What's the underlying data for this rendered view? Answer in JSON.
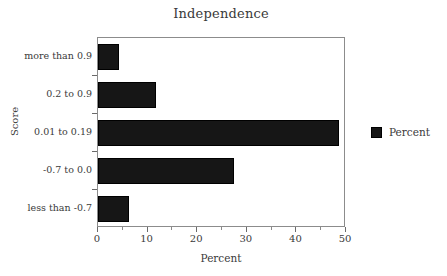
{
  "chart_data": {
    "type": "bar",
    "orientation": "horizontal",
    "title": "Independence",
    "xlabel": "Percent",
    "ylabel": "Score",
    "categories": [
      "less than -0.7",
      "-0.7 to 0.0",
      "0.01 to 0.19",
      "0.2 to 0.9",
      "more than 0.9"
    ],
    "values": [
      6.3,
      27.4,
      48.5,
      11.7,
      4.2
    ],
    "series": [
      {
        "name": "Percent",
        "values": [
          6.3,
          27.4,
          48.5,
          11.7,
          4.2
        ],
        "color": "#161616"
      }
    ],
    "xlim": [
      0,
      50
    ],
    "x_major_ticks": [
      0,
      10,
      20,
      30,
      40,
      50
    ],
    "x_tick_labels": [
      "0",
      "10",
      "20",
      "30",
      "40",
      "50"
    ],
    "x_minor_ticks": [
      5,
      15,
      25,
      35,
      45
    ],
    "grid": false,
    "legend": {
      "position": "right",
      "entries": [
        {
          "label": "Percent",
          "color": "#161616"
        }
      ]
    },
    "bars_top_to_bottom": [
      {
        "category": "more than 0.9",
        "value": 4.2
      },
      {
        "category": "0.2 to 0.9",
        "value": 11.7
      },
      {
        "category": "0.01 to 0.19",
        "value": 48.5
      },
      {
        "category": "-0.7 to 0.0",
        "value": 27.4
      },
      {
        "category": "less than -0.7",
        "value": 6.3
      }
    ]
  }
}
